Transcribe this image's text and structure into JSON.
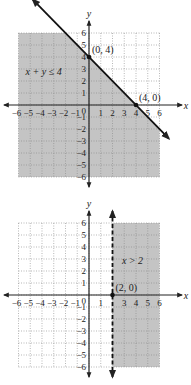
{
  "chart_data": [
    {
      "type": "line",
      "title": "",
      "xlabel": "x",
      "ylabel": "y",
      "xlim": [
        -6,
        6
      ],
      "ylim": [
        -6,
        6
      ],
      "grid": true,
      "x_ticks": [
        "-6",
        "-5",
        "-4",
        "-3",
        "-2",
        "-1",
        "1",
        "2",
        "3",
        "4",
        "5",
        "6"
      ],
      "y_ticks": [
        "6",
        "5",
        "4",
        "3",
        "2",
        "1",
        "-1",
        "-2",
        "-3",
        "-4",
        "-5",
        "-6"
      ],
      "origin_label": "0",
      "boundary": {
        "equation": "x + y = 4",
        "style": "solid",
        "points": [
          [
            -4.8,
            8.8
          ],
          [
            6.8,
            -2.8
          ]
        ]
      },
      "shaded_region": "below-left of line (x + y ≤ 4)",
      "inequality_label": "x + y ≤ 4",
      "points": [
        {
          "x": 0,
          "y": 4,
          "label": "(0, 4)"
        },
        {
          "x": 4,
          "y": 0,
          "label": "(4, 0)"
        }
      ],
      "fill_color": "#c4c4c4"
    },
    {
      "type": "line",
      "title": "",
      "xlabel": "x",
      "ylabel": "y",
      "xlim": [
        -6,
        6
      ],
      "ylim": [
        -6,
        6
      ],
      "grid": true,
      "x_ticks": [
        "-6",
        "-5",
        "-4",
        "-3",
        "-2",
        "-1",
        "1",
        "3",
        "4",
        "5",
        "6"
      ],
      "y_ticks": [
        "6",
        "5",
        "4",
        "3",
        "2",
        "1",
        "-1",
        "-2",
        "-3",
        "-4",
        "-5",
        "-6"
      ],
      "origin_label": "0",
      "boundary": {
        "equation": "x = 2",
        "style": "dashed"
      },
      "shaded_region": "right of line (x > 2)",
      "inequality_label": "x > 2",
      "points": [
        {
          "x": 2,
          "y": 0,
          "label": "(2, 0)"
        }
      ],
      "fill_color": "#c4c4c4"
    }
  ]
}
